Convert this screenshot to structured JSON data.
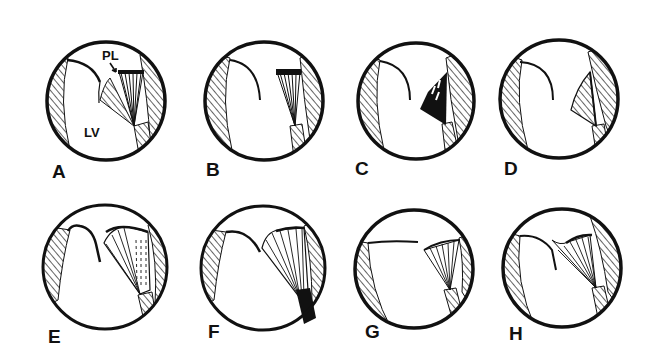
{
  "figure": {
    "colors": {
      "ink": "#111111",
      "background": "#ffffff"
    },
    "annotations": {
      "posterior_leaflet": "PL",
      "left_ventricle": "LV"
    },
    "panels": [
      {
        "id": "A",
        "label": "A",
        "cx": 106,
        "cy": 101,
        "r": 60,
        "label_x": 52,
        "label_y": 178
      },
      {
        "id": "B",
        "label": "B",
        "cx": 264,
        "cy": 101,
        "r": 60,
        "label_x": 206,
        "label_y": 176
      },
      {
        "id": "C",
        "label": "C",
        "cx": 416,
        "cy": 101,
        "r": 59,
        "label_x": 355,
        "label_y": 175
      },
      {
        "id": "D",
        "label": "D",
        "cx": 559,
        "cy": 99,
        "r": 60,
        "label_x": 504,
        "label_y": 175
      },
      {
        "id": "E",
        "label": "E",
        "cx": 105,
        "cy": 267,
        "r": 63,
        "label_x": 48,
        "label_y": 343
      },
      {
        "id": "F",
        "label": "F",
        "cx": 263,
        "cy": 268,
        "r": 63,
        "label_x": 208,
        "label_y": 338
      },
      {
        "id": "G",
        "label": "G",
        "cx": 414,
        "cy": 269,
        "r": 60,
        "label_x": 365,
        "label_y": 338
      },
      {
        "id": "H",
        "label": "H",
        "cx": 562,
        "cy": 268,
        "r": 60,
        "label_x": 509,
        "label_y": 340
      }
    ]
  }
}
